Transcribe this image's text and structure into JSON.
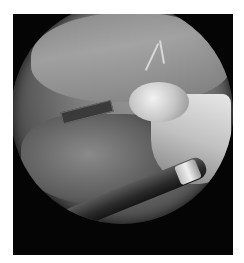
{
  "image": {
    "description": "Grayscale laparoscopic surgical view inside a circular endoscope field on a black square frame",
    "style": "grayscale",
    "colors": {
      "background": "#ffffff",
      "frame": "#050505",
      "tissue_mid": "#8c8c8c",
      "highlight": "#f0f0f0"
    },
    "regions": [
      {
        "name": "upper-peritoneal-surface",
        "note": "smooth gray tissue with branching vessel near top center"
      },
      {
        "name": "bright-fat-bulge",
        "note": "pale rounded tissue right of center"
      },
      {
        "name": "mesentery",
        "note": "vascular membranous tissue lower left"
      },
      {
        "name": "left-instrument",
        "note": "dark grasper entering from left"
      },
      {
        "name": "bottom-instrument",
        "note": "dark cylindrical instrument with metallic sleeve lower right"
      }
    ]
  }
}
